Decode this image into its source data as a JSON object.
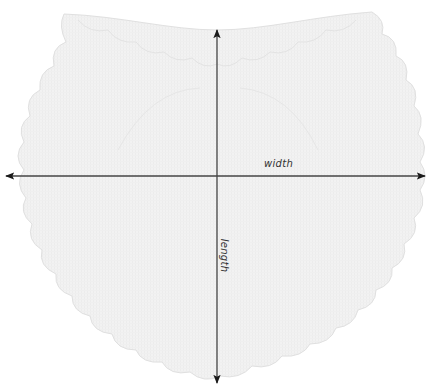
{
  "diagram": {
    "labels": {
      "width": "width",
      "length": "length"
    },
    "colors": {
      "fabric": "#f1f1f1",
      "fabric_edge": "#e2e2e2",
      "stitch_line": "#e4e4e4",
      "arrow": "#222222",
      "background": "#ffffff"
    },
    "arrows": [
      {
        "name": "width",
        "orientation": "horizontal",
        "from": [
          5,
          176
        ],
        "to": [
          426,
          176
        ]
      },
      {
        "name": "length",
        "orientation": "vertical",
        "from": [
          217,
          28
        ],
        "to": [
          217,
          384
        ]
      }
    ]
  }
}
